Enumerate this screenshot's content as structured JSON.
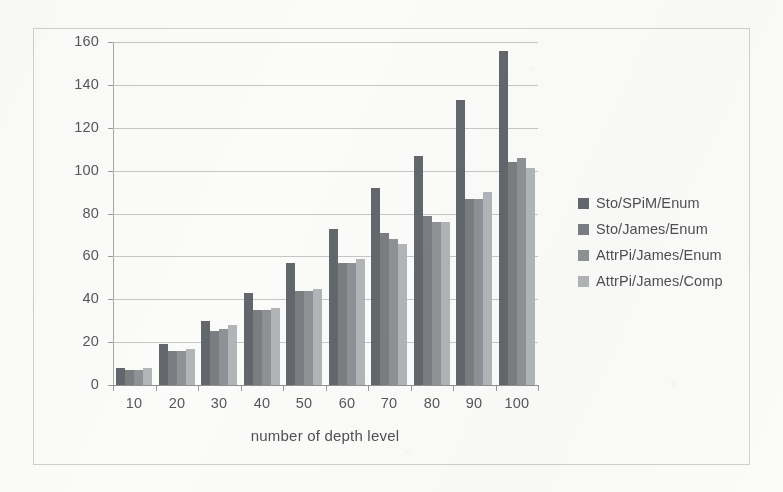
{
  "chart_data": {
    "type": "bar",
    "title": "",
    "xlabel": "number of depth level",
    "ylabel": "runtime in s",
    "categories": [
      "10",
      "20",
      "30",
      "40",
      "50",
      "60",
      "70",
      "80",
      "90",
      "100"
    ],
    "series": [
      {
        "name": "Sto/SPiM/Enum",
        "color": "#63666a",
        "values": [
          8,
          19,
          30,
          43,
          57,
          73,
          92,
          107,
          133,
          156
        ]
      },
      {
        "name": "Sto/James/Enum",
        "color": "#7b7e81",
        "values": [
          7,
          16,
          25,
          35,
          44,
          57,
          71,
          79,
          87,
          104
        ]
      },
      {
        "name": "AttrPi/James/Enum",
        "color": "#8f9295",
        "values": [
          7,
          16,
          26,
          35,
          44,
          57,
          68,
          76,
          87,
          106
        ]
      },
      {
        "name": "AttrPi/James/Comp",
        "color": "#b2b5b8",
        "values": [
          8,
          17,
          28,
          36,
          45,
          59,
          66,
          76,
          90,
          101
        ]
      }
    ],
    "ylim": [
      0,
      160
    ],
    "yticks": [
      "0",
      "20",
      "40",
      "60",
      "80",
      "100",
      "120",
      "140",
      "160"
    ],
    "grid": true,
    "legend_position": "right"
  },
  "legend": {
    "entries": [
      {
        "label": "Sto/SPiM/Enum"
      },
      {
        "label": "Sto/James/Enum"
      },
      {
        "label": "AttrPi/James/Enum"
      },
      {
        "label": "AttrPi/James/Comp"
      }
    ]
  },
  "icons": {
    "legend_swatch": "square-swatch-icon"
  }
}
